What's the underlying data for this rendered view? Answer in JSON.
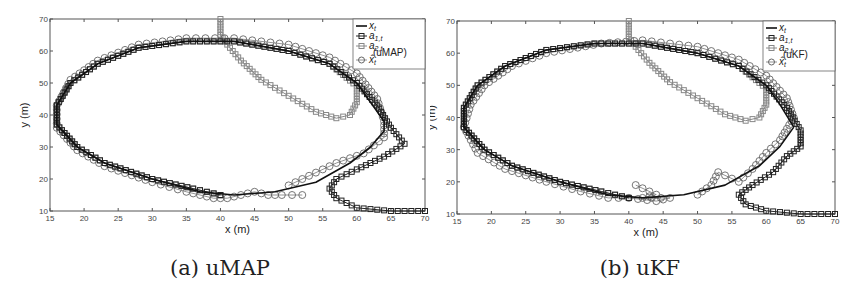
{
  "figure": {
    "panels": [
      {
        "id": "a",
        "caption": "(a) uMAP",
        "estimator": "uMAP"
      },
      {
        "id": "b",
        "caption": "(b) uKF",
        "estimator": "uKF"
      }
    ]
  },
  "chart_data": [
    {
      "type": "line",
      "title": "(a) uMAP",
      "xlabel": "x (m)",
      "ylabel": "y (m)",
      "xlim": [
        15,
        70
      ],
      "ylim": [
        10,
        70
      ],
      "xticks": [
        15,
        20,
        25,
        30,
        35,
        40,
        45,
        50,
        55,
        60,
        65,
        70
      ],
      "yticks": [
        10,
        20,
        30,
        40,
        50,
        60,
        70
      ],
      "grid": false,
      "legend_position": "upper right",
      "legend": [
        "x_t",
        "a_{1,t}",
        "a_{2,t}",
        "x̂_t^(uMAP)"
      ],
      "series": [
        {
          "name": "x_t",
          "style": "solid black line",
          "points": [
            [
              64,
              38
            ],
            [
              62,
              44
            ],
            [
              60,
              50
            ],
            [
              56,
              56
            ],
            [
              50,
              60
            ],
            [
              42,
              63
            ],
            [
              35,
              63
            ],
            [
              28,
              61
            ],
            [
              22,
              56
            ],
            [
              18,
              50
            ],
            [
              16,
              43
            ],
            [
              16,
              37
            ],
            [
              19,
              30
            ],
            [
              23,
              25
            ],
            [
              30,
              20
            ],
            [
              37,
              16
            ],
            [
              42,
              15
            ],
            [
              48,
              16
            ],
            [
              54,
              19
            ],
            [
              59,
              25
            ],
            [
              62,
              30
            ],
            [
              64,
              35
            ],
            [
              64,
              38
            ]
          ]
        },
        {
          "name": "a_{1,t}",
          "style": "black line with square markers",
          "points": [
            [
              70,
              10
            ],
            [
              65,
              10
            ],
            [
              60,
              11
            ],
            [
              57,
              14
            ],
            [
              56,
              17
            ],
            [
              57,
              20
            ],
            [
              60,
              23
            ],
            [
              64,
              27
            ],
            [
              67,
              31
            ],
            [
              65,
              36
            ],
            [
              63,
              43
            ],
            [
              60,
              50
            ],
            [
              56,
              56
            ],
            [
              50,
              60
            ],
            [
              42,
              63
            ],
            [
              35,
              63
            ],
            [
              28,
              61
            ],
            [
              22,
              56
            ],
            [
              18,
              50
            ],
            [
              16,
              43
            ],
            [
              16,
              37
            ],
            [
              19,
              30
            ],
            [
              23,
              25
            ],
            [
              30,
              20
            ],
            [
              36,
              17
            ],
            [
              40,
              15
            ]
          ]
        },
        {
          "name": "a_{2,t}",
          "style": "gray line with square markers",
          "points": [
            [
              40,
              70
            ],
            [
              40,
              65
            ],
            [
              41,
              62
            ],
            [
              43,
              57
            ],
            [
              46,
              51
            ],
            [
              50,
              46
            ],
            [
              54,
              41
            ],
            [
              57,
              39
            ],
            [
              59,
              40
            ],
            [
              60,
              44
            ],
            [
              60,
              49
            ],
            [
              56,
              56
            ],
            [
              50,
              60
            ],
            [
              42,
              63
            ],
            [
              35,
              63
            ],
            [
              28,
              61
            ],
            [
              22,
              56
            ],
            [
              18,
              50
            ],
            [
              16,
              43
            ],
            [
              16,
              37
            ],
            [
              19,
              30
            ],
            [
              23,
              25
            ],
            [
              30,
              20
            ],
            [
              36,
              17
            ],
            [
              40,
              15
            ]
          ]
        },
        {
          "name": "x̂_t^(uMAP)",
          "style": "gray line with circle markers",
          "points": [
            [
              52,
              15
            ],
            [
              49,
              15
            ],
            [
              47,
              15
            ],
            [
              45,
              16
            ],
            [
              43,
              15
            ],
            [
              41,
              14
            ],
            [
              39,
              14
            ],
            [
              37,
              15
            ],
            [
              35,
              16
            ],
            [
              30,
              19
            ],
            [
              23,
              24
            ],
            [
              19,
              29
            ],
            [
              16,
              36
            ],
            [
              16,
              43
            ],
            [
              18,
              51
            ],
            [
              22,
              57
            ],
            [
              28,
              62
            ],
            [
              35,
              64
            ],
            [
              42,
              64
            ],
            [
              50,
              62
            ],
            [
              56,
              58
            ],
            [
              60,
              53
            ],
            [
              63,
              45
            ],
            [
              64,
              38
            ],
            [
              64,
              33
            ],
            [
              61,
              28
            ],
            [
              57,
              25
            ],
            [
              53,
              21
            ],
            [
              50,
              18
            ]
          ]
        }
      ]
    },
    {
      "type": "line",
      "title": "(b) uKF",
      "xlabel": "x (m)",
      "ylabel": "y (m)",
      "xlim": [
        15,
        70
      ],
      "ylim": [
        10,
        70
      ],
      "xticks": [
        15,
        20,
        25,
        30,
        35,
        40,
        45,
        50,
        55,
        60,
        65,
        70
      ],
      "yticks": [
        10,
        20,
        30,
        40,
        50,
        60,
        70
      ],
      "grid": false,
      "legend_position": "upper right",
      "legend": [
        "x_t",
        "a_{1,t}",
        "a_{2,t}",
        "x̂_t^(uKF)"
      ],
      "series": [
        {
          "name": "x_t",
          "style": "solid black line",
          "points": [
            [
              64,
              37
            ],
            [
              62,
              44
            ],
            [
              60,
              50
            ],
            [
              56,
              56
            ],
            [
              50,
              60
            ],
            [
              42,
              63
            ],
            [
              35,
              63
            ],
            [
              28,
              61
            ],
            [
              22,
              56
            ],
            [
              18,
              50
            ],
            [
              16,
              43
            ],
            [
              16,
              37
            ],
            [
              19,
              30
            ],
            [
              23,
              25
            ],
            [
              30,
              20
            ],
            [
              37,
              16
            ],
            [
              42,
              15
            ],
            [
              48,
              16
            ],
            [
              54,
              19
            ],
            [
              59,
              25
            ],
            [
              62,
              31
            ],
            [
              64,
              37
            ]
          ]
        },
        {
          "name": "a_{1,t}",
          "style": "black line with square markers",
          "points": [
            [
              70,
              10
            ],
            [
              65,
              10
            ],
            [
              60,
              11
            ],
            [
              57,
              13
            ],
            [
              56,
              16
            ],
            [
              58,
              19
            ],
            [
              61,
              23
            ],
            [
              63,
              28
            ],
            [
              65,
              31
            ],
            [
              65,
              36
            ],
            [
              63,
              43
            ],
            [
              60,
              50
            ],
            [
              56,
              56
            ],
            [
              50,
              60
            ],
            [
              42,
              63
            ],
            [
              35,
              63
            ],
            [
              28,
              61
            ],
            [
              22,
              56
            ],
            [
              18,
              50
            ],
            [
              16,
              43
            ],
            [
              16,
              37
            ],
            [
              19,
              30
            ],
            [
              23,
              25
            ],
            [
              30,
              20
            ],
            [
              36,
              17
            ],
            [
              40,
              15
            ]
          ]
        },
        {
          "name": "a_{2,t}",
          "style": "gray line with square markers",
          "points": [
            [
              40,
              70
            ],
            [
              40,
              65
            ],
            [
              41,
              62
            ],
            [
              43,
              57
            ],
            [
              46,
              51
            ],
            [
              50,
              46
            ],
            [
              54,
              41
            ],
            [
              57,
              39
            ],
            [
              59,
              40
            ],
            [
              60,
              44
            ],
            [
              60,
              49
            ],
            [
              56,
              56
            ],
            [
              50,
              60
            ],
            [
              42,
              63
            ],
            [
              35,
              63
            ],
            [
              28,
              61
            ],
            [
              22,
              56
            ],
            [
              18,
              50
            ],
            [
              16,
              43
            ],
            [
              16,
              37
            ],
            [
              19,
              30
            ],
            [
              23,
              25
            ],
            [
              30,
              20
            ],
            [
              36,
              17
            ],
            [
              40,
              15
            ]
          ]
        },
        {
          "name": "x̂_t^(uKF)",
          "style": "gray line with circle markers",
          "points": [
            [
              41,
              19
            ],
            [
              44,
              16
            ],
            [
              42,
              15
            ],
            [
              46,
              15
            ],
            [
              44,
              14
            ],
            [
              40,
              15
            ],
            [
              37,
              15
            ],
            [
              33,
              17
            ],
            [
              28,
              20
            ],
            [
              22,
              24
            ],
            [
              18,
              29
            ],
            [
              16,
              37
            ],
            [
              17,
              44
            ],
            [
              19,
              50
            ],
            [
              23,
              56
            ],
            [
              28,
              60
            ],
            [
              36,
              63
            ],
            [
              42,
              64
            ],
            [
              50,
              62
            ],
            [
              56,
              58
            ],
            [
              60,
              53
            ],
            [
              63,
              46
            ],
            [
              64,
              40
            ],
            [
              62,
              33
            ],
            [
              60,
              29
            ],
            [
              58,
              24
            ],
            [
              56,
              20
            ],
            [
              53,
              23
            ],
            [
              52,
              19
            ],
            [
              50,
              16
            ]
          ]
        }
      ]
    }
  ]
}
